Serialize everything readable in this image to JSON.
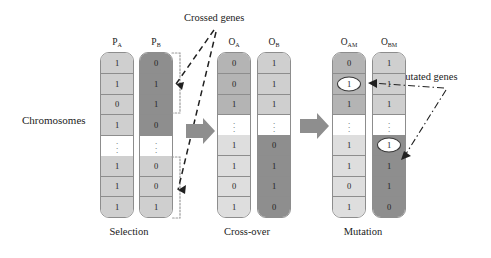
{
  "diagram": {
    "title_hidden": "Genetic algorithm operators",
    "side_label": "Chromosomes",
    "annotations": [
      {
        "name": "crossed-genes",
        "text": "Crossed genes"
      },
      {
        "name": "mutated-genes",
        "text": "Mutated genes"
      }
    ],
    "stages": [
      {
        "name": "selection",
        "caption": "Selection"
      },
      {
        "name": "cross-over",
        "caption": "Cross-over"
      },
      {
        "name": "mutation",
        "caption": "Mutation"
      }
    ],
    "arrows": [
      {
        "name": "arrow-selection-to-crossover",
        "shape": "block-arrow-right",
        "color": "#8e8e8e"
      },
      {
        "name": "arrow-crossover-to-mutation",
        "shape": "block-arrow-right",
        "color": "#8e8e8e"
      }
    ],
    "columns": [
      {
        "name": "parent-a",
        "label": "P",
        "subscript": "A",
        "stage": "selection",
        "cells": [
          {
            "value": "1",
            "shade": "f-light",
            "circled": false
          },
          {
            "value": "1",
            "shade": "f-light",
            "circled": false
          },
          {
            "value": "0",
            "shade": "f-light",
            "circled": false
          },
          {
            "value": "1",
            "shade": "f-light",
            "circled": false
          },
          {
            "value": "",
            "shade": "dots",
            "circled": false
          },
          {
            "value": "1",
            "shade": "f-light",
            "circled": false
          },
          {
            "value": "1",
            "shade": "f-light",
            "circled": false
          },
          {
            "value": "1",
            "shade": "f-light",
            "circled": false
          }
        ]
      },
      {
        "name": "parent-b",
        "label": "P",
        "subscript": "B",
        "stage": "selection",
        "cells": [
          {
            "value": "0",
            "shade": "f-dark",
            "circled": false
          },
          {
            "value": "1",
            "shade": "f-dark",
            "circled": false
          },
          {
            "value": "1",
            "shade": "f-dark",
            "circled": false
          },
          {
            "value": "0",
            "shade": "f-dark",
            "circled": false
          },
          {
            "value": "",
            "shade": "dots",
            "circled": false
          },
          {
            "value": "0",
            "shade": "f-light",
            "circled": false
          },
          {
            "value": "0",
            "shade": "f-light",
            "circled": false
          },
          {
            "value": "1",
            "shade": "f-light",
            "circled": false
          }
        ]
      },
      {
        "name": "offspring-a",
        "label": "O",
        "subscript": "A",
        "stage": "cross-over",
        "cells": [
          {
            "value": "0",
            "shade": "f-mid",
            "circled": false
          },
          {
            "value": "0",
            "shade": "f-mid",
            "circled": false
          },
          {
            "value": "1",
            "shade": "f-mid",
            "circled": false
          },
          {
            "value": "",
            "shade": "dots",
            "circled": false
          },
          {
            "value": "1",
            "shade": "f-pale",
            "circled": false
          },
          {
            "value": "1",
            "shade": "f-pale",
            "circled": false
          },
          {
            "value": "0",
            "shade": "f-pale",
            "circled": false
          },
          {
            "value": "1",
            "shade": "f-pale",
            "circled": false
          }
        ]
      },
      {
        "name": "offspring-b",
        "label": "O",
        "subscript": "B",
        "stage": "cross-over",
        "cells": [
          {
            "value": "1",
            "shade": "f-light",
            "circled": false
          },
          {
            "value": "1",
            "shade": "f-light",
            "circled": false
          },
          {
            "value": "1",
            "shade": "f-light",
            "circled": false
          },
          {
            "value": "",
            "shade": "dots",
            "circled": false
          },
          {
            "value": "0",
            "shade": "f-dark",
            "circled": false
          },
          {
            "value": "1",
            "shade": "f-dark",
            "circled": false
          },
          {
            "value": "1",
            "shade": "f-dark",
            "circled": false
          },
          {
            "value": "0",
            "shade": "f-dark",
            "circled": false
          }
        ]
      },
      {
        "name": "offspring-a-mutated",
        "label": "O",
        "subscript": "AM",
        "stage": "mutation",
        "cells": [
          {
            "value": "0",
            "shade": "f-mid",
            "circled": false
          },
          {
            "value": "1",
            "shade": "f-mid",
            "circled": true
          },
          {
            "value": "1",
            "shade": "f-mid",
            "circled": false
          },
          {
            "value": "",
            "shade": "dots",
            "circled": false
          },
          {
            "value": "1",
            "shade": "f-pale",
            "circled": false
          },
          {
            "value": "1",
            "shade": "f-pale",
            "circled": false
          },
          {
            "value": "0",
            "shade": "f-pale",
            "circled": false
          },
          {
            "value": "1",
            "shade": "f-pale",
            "circled": false
          }
        ]
      },
      {
        "name": "offspring-b-mutated",
        "label": "O",
        "subscript": "BM",
        "stage": "mutation",
        "cells": [
          {
            "value": "1",
            "shade": "f-light",
            "circled": false
          },
          {
            "value": "1",
            "shade": "f-light",
            "circled": false
          },
          {
            "value": "1",
            "shade": "f-light",
            "circled": false
          },
          {
            "value": "",
            "shade": "dots",
            "circled": false
          },
          {
            "value": "1",
            "shade": "f-dark",
            "circled": true
          },
          {
            "value": "1",
            "shade": "f-dark",
            "circled": false
          },
          {
            "value": "1",
            "shade": "f-dark",
            "circled": false
          },
          {
            "value": "0",
            "shade": "f-dark",
            "circled": false
          }
        ]
      }
    ],
    "colors": {
      "dark": "#8e8e8e",
      "mid": "#b4b4b4",
      "light": "#cfcfcf",
      "pale": "#dedede",
      "outline": "#8d8d8d",
      "text": "#1b1b1b"
    }
  }
}
